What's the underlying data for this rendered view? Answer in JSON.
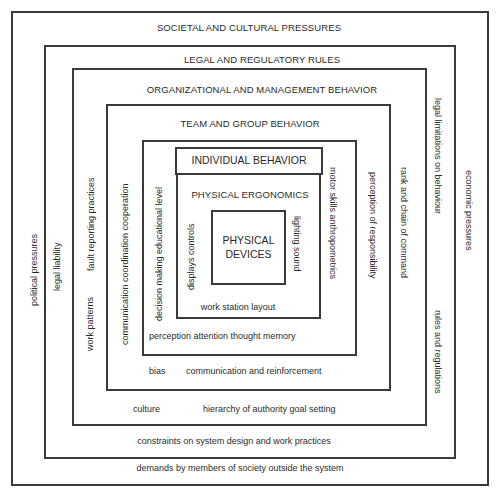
{
  "diagram": {
    "layers": {
      "societal": {
        "title": "SOCIETAL AND CULTURAL PRESSURES",
        "left": "political pressures",
        "right": "economic pressures",
        "bottom": "demands by members of society outside the system"
      },
      "legal": {
        "title": "LEGAL AND REGULATORY RULES",
        "left": "legal liability",
        "right_top": "legal limitations on behaviour",
        "right_bottom": "rules and regulations",
        "bottom": "constraints on system design and work practices"
      },
      "organizational": {
        "title": "ORGANIZATIONAL AND MANAGEMENT BEHAVIOR",
        "left_top": "fault reporting practices",
        "left_bottom": "work patterns",
        "right": "rank and chain of command",
        "bottom_left": "culture",
        "bottom_right": "hierarchy of authority  goal setting"
      },
      "team": {
        "title": "TEAM AND GROUP BEHAVIOR",
        "left": "communication  coordination  cooperation",
        "right": "perception of responsibility",
        "bottom_left": "bias",
        "bottom_right": "communication and reinforcement"
      },
      "individual": {
        "title": "INDIVIDUAL BEHAVIOR",
        "left": "decision making  educational level",
        "right": "motor skills  anthropometrics",
        "bottom": "perception  attention   thought  memory"
      },
      "ergonomics": {
        "title": "PHYSICAL ERGONOMICS",
        "left": "displays  controls",
        "right": "lighting sound",
        "bottom": "work station layout"
      },
      "devices": {
        "line1": "PHYSICAL",
        "line2": "DEVICES"
      }
    },
    "colors": {
      "line": "#3a3a3a",
      "text": "#2b2b2b",
      "background": "#ffffff"
    }
  }
}
